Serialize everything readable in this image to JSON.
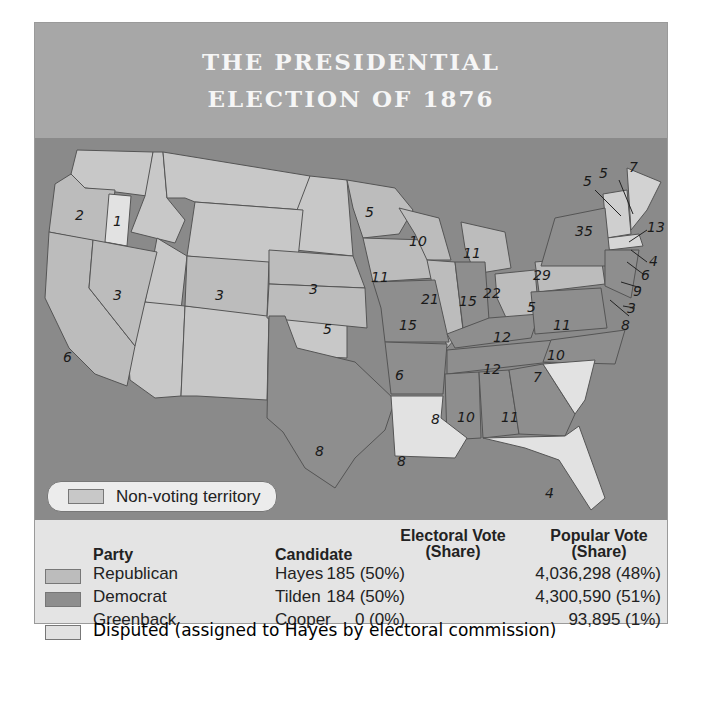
{
  "title": {
    "line1": "THE PRESIDENTIAL",
    "line2": "ELECTION OF 1876"
  },
  "colors": {
    "header_bg": "#a7a7a7",
    "water": "#8a8a8a",
    "republican": "#bcbcbc",
    "democrat": "#8e8e8e",
    "disputed": "#e2e2e2",
    "non_voting": "#c8c8c8",
    "legend_bg": "#e4e4e4"
  },
  "map": {
    "non_voting_label": "Non-voting territory",
    "states": [
      {
        "name": "Oregon",
        "ev": "2",
        "party": "republican"
      },
      {
        "name": "Oregon (disputed elector)",
        "ev": "1",
        "party": "disputed"
      },
      {
        "name": "California",
        "ev": "6",
        "party": "republican"
      },
      {
        "name": "Nevada",
        "ev": "3",
        "party": "republican"
      },
      {
        "name": "Colorado",
        "ev": "3",
        "party": "republican"
      },
      {
        "name": "Nebraska",
        "ev": "3",
        "party": "republican"
      },
      {
        "name": "Kansas",
        "ev": "5",
        "party": "republican"
      },
      {
        "name": "Texas",
        "ev": "8",
        "party": "democrat"
      },
      {
        "name": "Minnesota",
        "ev": "5",
        "party": "republican"
      },
      {
        "name": "Iowa",
        "ev": "11",
        "party": "republican"
      },
      {
        "name": "Wisconsin",
        "ev": "10",
        "party": "republican"
      },
      {
        "name": "Illinois",
        "ev": "21",
        "party": "republican"
      },
      {
        "name": "Michigan",
        "ev": "11",
        "party": "republican"
      },
      {
        "name": "Indiana",
        "ev": "15",
        "party": "democrat"
      },
      {
        "name": "Ohio",
        "ev": "22",
        "party": "republican"
      },
      {
        "name": "Missouri",
        "ev": "15",
        "party": "democrat"
      },
      {
        "name": "Kentucky",
        "ev": "12",
        "party": "democrat"
      },
      {
        "name": "Tennessee",
        "ev": "12",
        "party": "democrat"
      },
      {
        "name": "Arkansas",
        "ev": "6",
        "party": "democrat"
      },
      {
        "name": "Louisiana",
        "ev": "8",
        "party": "disputed"
      },
      {
        "name": "Mississippi",
        "ev": "8",
        "party": "democrat"
      },
      {
        "name": "Alabama",
        "ev": "10",
        "party": "democrat"
      },
      {
        "name": "Georgia",
        "ev": "11",
        "party": "democrat"
      },
      {
        "name": "Florida",
        "ev": "4",
        "party": "disputed"
      },
      {
        "name": "South Carolina",
        "ev": "7",
        "party": "disputed"
      },
      {
        "name": "North Carolina",
        "ev": "10",
        "party": "democrat"
      },
      {
        "name": "Virginia",
        "ev": "11",
        "party": "democrat"
      },
      {
        "name": "West Virginia",
        "ev": "5",
        "party": "democrat"
      },
      {
        "name": "Pennsylvania",
        "ev": "29",
        "party": "republican"
      },
      {
        "name": "New York",
        "ev": "35",
        "party": "democrat"
      },
      {
        "name": "Vermont",
        "ev": "5",
        "party": "republican"
      },
      {
        "name": "New Hampshire",
        "ev": "5",
        "party": "republican"
      },
      {
        "name": "Maine",
        "ev": "7",
        "party": "republican"
      },
      {
        "name": "Massachusetts",
        "ev": "13",
        "party": "republican"
      },
      {
        "name": "Rhode Island",
        "ev": "4",
        "party": "republican"
      },
      {
        "name": "Connecticut",
        "ev": "6",
        "party": "democrat"
      },
      {
        "name": "New Jersey",
        "ev": "9",
        "party": "democrat"
      },
      {
        "name": "Delaware",
        "ev": "3",
        "party": "democrat"
      },
      {
        "name": "Maryland",
        "ev": "8",
        "party": "democrat"
      }
    ]
  },
  "legend": {
    "headers": {
      "party": "Party",
      "candidate": "Candidate",
      "ev_line1": "Electoral Vote",
      "ev_line2": "(Share)",
      "pv_line1": "Popular Vote",
      "pv_line2": "(Share)"
    },
    "rows": [
      {
        "party": "Republican",
        "candidate": "Hayes",
        "ev": "185 (50%)",
        "pv": "4,036,298 (48%)",
        "swatch": "republican"
      },
      {
        "party": "Democrat",
        "candidate": "Tilden",
        "ev": "184 (50%)",
        "pv": "4,300,590 (51%)",
        "swatch": "democrat"
      },
      {
        "party": "Greenback",
        "candidate": "Cooper",
        "ev": "0 (0%)",
        "pv": "93,895 (1%)",
        "swatch": null
      }
    ],
    "disputed_label": "Disputed (assigned to Hayes by electoral commission)"
  }
}
